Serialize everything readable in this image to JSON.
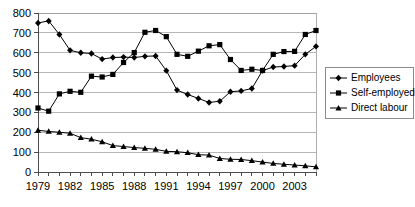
{
  "chart_data": {
    "type": "line",
    "title": "",
    "subtitle": "",
    "xlabel": "",
    "ylabel": "",
    "ylim": [
      0,
      800
    ],
    "ytick_step": 100,
    "ytick_labels": [
      "0",
      "100",
      "200",
      "300",
      "400",
      "500",
      "600",
      "700",
      "800"
    ],
    "grid": true,
    "grid_orientation": "horizontal",
    "legend_position": "right",
    "xlim": [
      1979,
      2005
    ],
    "x": [
      1979,
      1980,
      1981,
      1982,
      1983,
      1984,
      1985,
      1986,
      1987,
      1988,
      1989,
      1990,
      1991,
      1992,
      1993,
      1994,
      1995,
      1996,
      1997,
      1998,
      1999,
      2000,
      2001,
      2002,
      2003,
      2004,
      2005
    ],
    "xtick_labels": [
      "1979",
      "1982",
      "1985",
      "1988",
      "1991",
      "1994",
      "1997",
      "2000",
      "2003"
    ],
    "xtick_label_years": [
      1979,
      1982,
      1985,
      1988,
      1991,
      1994,
      1997,
      2000,
      2003
    ],
    "series": [
      {
        "name": "Employees",
        "marker": "diamond",
        "color": "#000000",
        "values": [
          750,
          760,
          692,
          612,
          600,
          596,
          568,
          576,
          578,
          576,
          582,
          584,
          510,
          412,
          390,
          370,
          350,
          356,
          404,
          408,
          420,
          510,
          528,
          531,
          535,
          592,
          632
        ]
      },
      {
        "name": "Self-employed",
        "marker": "square",
        "color": "#000000",
        "values": [
          322,
          306,
          393,
          406,
          401,
          482,
          478,
          491,
          551,
          601,
          703,
          712,
          681,
          592,
          582,
          608,
          635,
          641,
          566,
          511,
          517,
          511,
          592,
          606,
          607,
          692,
          712
        ]
      },
      {
        "name": "Direct labour",
        "marker": "triangle",
        "color": "#000000",
        "values": [
          210,
          204,
          200,
          195,
          173,
          165,
          152,
          133,
          128,
          123,
          119,
          114,
          104,
          102,
          97,
          87,
          85,
          68,
          64,
          63,
          57,
          50,
          43,
          39,
          35,
          31,
          26
        ]
      }
    ]
  },
  "legend": {
    "entries": [
      {
        "label": "Employees",
        "marker": "diamond"
      },
      {
        "label": "Self-employed",
        "marker": "square"
      },
      {
        "label": "Direct labour",
        "marker": "triangle"
      }
    ]
  }
}
